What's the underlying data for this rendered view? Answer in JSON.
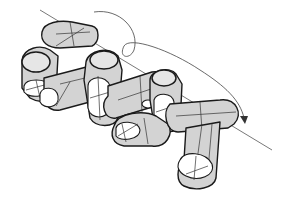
{
  "figure": {
    "colors": {
      "background": "#ffffff",
      "link_fill": "#d3d3d3",
      "link_end_fill": "#e6e6e6",
      "outline": "#1a1a1a",
      "axis_line": "#555555"
    },
    "link_count": 8,
    "elements": [
      "rotation-axis",
      "rotation-arrow",
      "tubular-links"
    ]
  }
}
